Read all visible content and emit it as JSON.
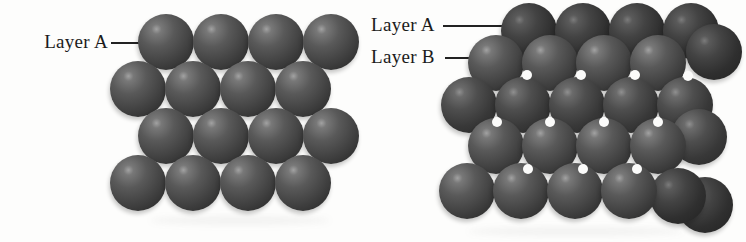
{
  "figure_title": "close-packing-of-spheres",
  "left_diagram": {
    "label_a": "Layer A",
    "sphere_diameter": 56,
    "sphere_shade": "bright",
    "rows": [
      {
        "name": "layer-a-row-1",
        "y": 42,
        "xs": [
          166,
          221,
          276,
          331
        ]
      },
      {
        "name": "layer-a-row-2",
        "y": 89,
        "xs": [
          138,
          193,
          248,
          303
        ]
      },
      {
        "name": "layer-a-row-3",
        "y": 136,
        "xs": [
          166,
          221,
          276,
          331
        ]
      },
      {
        "name": "layer-a-row-4",
        "y": 183,
        "xs": [
          138,
          193,
          248,
          303
        ]
      }
    ]
  },
  "right_diagram": {
    "label_a": "Layer A",
    "label_b": "Layer B",
    "sphere_diameter": 56,
    "bands": [
      {
        "name": "layer-a-row-1",
        "shade": "dark",
        "y": 31,
        "xs": [
          529,
          583,
          637,
          691
        ]
      },
      {
        "name": "edge-sphere-1",
        "shade": "dark",
        "y": 52,
        "xs": [
          714
        ]
      },
      {
        "name": "layer-b-row-1",
        "shade": "bright",
        "y": 63,
        "xs": [
          496,
          550,
          604,
          658
        ]
      },
      {
        "name": "layer-a-row-2",
        "shade": "medium",
        "y": 105,
        "xs": [
          469,
          523,
          577,
          631,
          685
        ]
      },
      {
        "name": "edge-sphere-2",
        "shade": "medium",
        "y": 137,
        "xs": [
          699
        ]
      },
      {
        "name": "layer-b-row-2",
        "shade": "bright",
        "y": 146,
        "xs": [
          496,
          550,
          604,
          658
        ]
      },
      {
        "name": "edge-sphere-3",
        "shade": "dark",
        "y": 205,
        "xs": [
          705
        ]
      },
      {
        "name": "edge-sphere-4",
        "shade": "dark",
        "y": 196,
        "xs": [
          678
        ]
      },
      {
        "name": "layer-a-row-3",
        "shade": "bright",
        "y": 191,
        "xs": [
          467,
          521,
          575,
          629
        ]
      }
    ],
    "holes": [
      [
        527,
        75
      ],
      [
        581,
        75
      ],
      [
        635,
        75
      ],
      [
        688,
        76
      ],
      [
        497,
        122
      ],
      [
        550,
        122
      ],
      [
        604,
        122
      ],
      [
        658,
        122
      ],
      [
        528,
        169
      ],
      [
        583,
        169
      ],
      [
        637,
        169
      ]
    ]
  },
  "colors": {
    "background": "#fdfdfc",
    "label_text": "#1b1b1b",
    "leader_line": "#222222",
    "sphere_body": "#4e4e4e",
    "sphere_highlight": "#a2a2a2",
    "sphere_shadow_edge": "#262626",
    "hole": "#fbfbfa"
  }
}
